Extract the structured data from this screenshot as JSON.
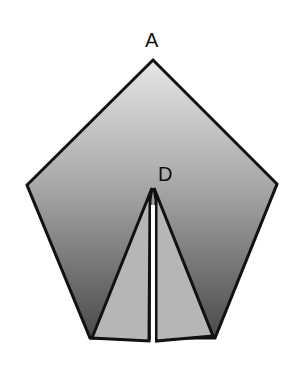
{
  "diagram": {
    "type": "geometry",
    "labels": {
      "apex": "A",
      "interior": "D"
    },
    "points": {
      "A": [
        153,
        60
      ],
      "left": [
        27,
        185
      ],
      "right": [
        277,
        184
      ],
      "bottom_left": [
        90,
        338
      ],
      "bottom_right": [
        215,
        338
      ],
      "D": [
        153,
        188
      ]
    },
    "colors": {
      "pentagon_gradient_top": "#e4e4e4",
      "pentagon_gradient_bottom": "#4f4f4f",
      "inner_triangles": "#b4b4b4",
      "stroke": "#111111",
      "gap": "#ffffff"
    }
  }
}
